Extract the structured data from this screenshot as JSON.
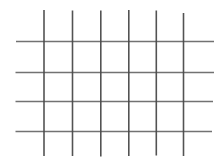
{
  "canvas": {
    "width": 224,
    "height": 162,
    "background_color": "#ffffff",
    "title": "Grid Lattice Drawing"
  },
  "chart_data": {
    "type": "line",
    "title": "",
    "subtitle": "",
    "xlabel": "",
    "ylabel": "",
    "legend": [],
    "annotations": [],
    "grid": true,
    "cells": {
      "columns": 5,
      "rows": 3
    },
    "axis_ranges": {
      "x": [
        0,
        224
      ],
      "y": [
        0,
        162
      ]
    }
  },
  "style": {
    "vertical_stroke_color": "#4a4a4a",
    "horizontal_stroke_color": "#6a6a6a",
    "vertical_stroke_width": 1.6,
    "horizontal_stroke_width": 1.5,
    "stroke_opacity": 0.95
  },
  "lines": {
    "vertical": [
      {
        "id": "v1",
        "label": "vertical-line-1",
        "x": 44.0,
        "y1": 10.0,
        "y2": 156.0
      },
      {
        "id": "v2",
        "label": "vertical-line-2",
        "x": 72.5,
        "y1": 10.5,
        "y2": 156.0
      },
      {
        "id": "v3",
        "label": "vertical-line-3",
        "x": 100.8,
        "y1": 10.5,
        "y2": 156.5
      },
      {
        "id": "v4",
        "label": "vertical-line-4",
        "x": 128.8,
        "y1": 10.0,
        "y2": 156.0
      },
      {
        "id": "v5",
        "label": "vertical-line-5",
        "x": 156.3,
        "y1": 10.5,
        "y2": 155.5
      },
      {
        "id": "v6",
        "label": "vertical-line-6",
        "x": 183.5,
        "y1": 13.0,
        "y2": 156.0
      }
    ],
    "horizontal": [
      {
        "id": "h1",
        "label": "horizontal-line-1",
        "y": 41.5,
        "x1": 16.0,
        "x2": 214.0
      },
      {
        "id": "h2",
        "label": "horizontal-line-2",
        "y": 72.5,
        "x1": 15.5,
        "x2": 214.0
      },
      {
        "id": "h3",
        "label": "horizontal-line-3",
        "y": 101.5,
        "x1": 15.5,
        "x2": 213.0
      },
      {
        "id": "h4",
        "label": "horizontal-line-4",
        "y": 131.5,
        "x1": 15.5,
        "x2": 212.0
      }
    ]
  }
}
